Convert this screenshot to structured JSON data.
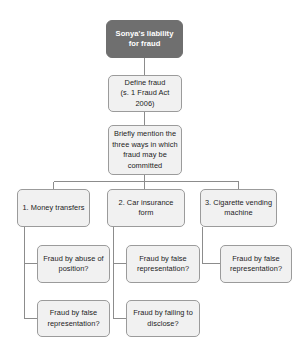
{
  "diagram": {
    "title_node": {
      "label": "Sonya's liability for fraud",
      "fill": "#6f6f6f",
      "text_color": "#ffffff"
    },
    "chain": [
      {
        "id": "define-fraud",
        "label": "Define fraud\n(s. 1 Fraud Act\n2006)"
      },
      {
        "id": "three-ways",
        "label": "Briefly mention the\nthree ways in which\nfraud may be\ncommitted"
      }
    ],
    "branches": [
      {
        "id": "money-transfers",
        "label": "1. Money transfers",
        "children": [
          {
            "id": "abuse-of-position",
            "label": "Fraud by abuse of\nposition?"
          },
          {
            "id": "false-representation-1",
            "label": "Fraud by false\nrepresentation?"
          }
        ]
      },
      {
        "id": "car-insurance-form",
        "label": "2. Car insurance form",
        "children": [
          {
            "id": "false-representation-2",
            "label": "Fraud by false\nrepresentation?"
          },
          {
            "id": "failing-to-disclose",
            "label": "Fraud by failing to\ndisclose?"
          }
        ]
      },
      {
        "id": "cigarette-vending-machine",
        "label": "3. Cigarette vending\nmachine",
        "children": [
          {
            "id": "false-representation-3",
            "label": "Fraud by false\nrepresentation?"
          }
        ]
      }
    ],
    "style": {
      "node_fill": "#f1f1f1",
      "node_border": "#9b9b9b",
      "connector_color": "#8c8c8c",
      "background": "#ffffff"
    }
  }
}
